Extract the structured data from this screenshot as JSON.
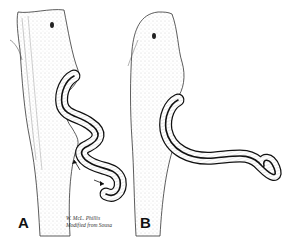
{
  "figure": {
    "panels": [
      {
        "id": "A",
        "label": "A"
      },
      {
        "id": "B",
        "label": "B"
      }
    ],
    "signature": {
      "line1": "W. McL. Phillis",
      "line2": "Modified from Sousa"
    },
    "annotation_A": "S.O.",
    "colors": {
      "ink": "#111111",
      "background": "#ffffff",
      "hatch": "#888888"
    }
  }
}
